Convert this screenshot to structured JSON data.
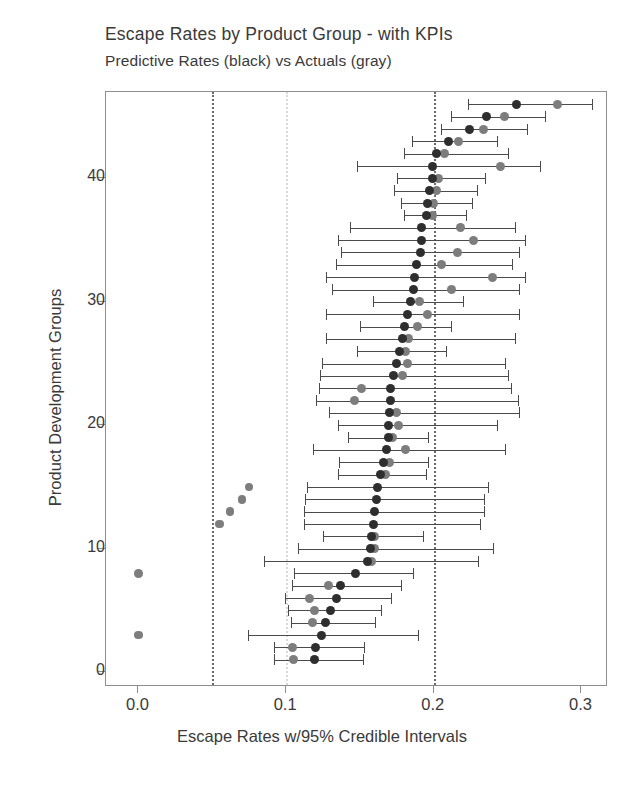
{
  "chart": {
    "title": "Escape Rates by Product Group - with KPIs",
    "subtitle": "Predictive Rates (black) vs Actuals (gray)",
    "xlabel": "Escape Rates w/95% Credible Intervals",
    "ylabel": "Product Development Groups",
    "xticklabels": [
      "0.0",
      "0.1",
      "0.2",
      "0.3"
    ],
    "yticklabels": [
      "0",
      "10",
      "20",
      "30",
      "40"
    ]
  },
  "colors": {
    "predictive": "#2e2e2e",
    "actual": "#7d7d7d",
    "interval": "#4a4a4a",
    "refline": "#6a6a6a",
    "refline_faint": "#d9d9d9",
    "frame": "#8d8d8d",
    "text": "#3a3a3a",
    "background": "#ffffff"
  },
  "chart_data": {
    "type": "scatter",
    "title": "Escape Rates by Product Group - with KPIs",
    "subtitle": "Predictive Rates (black) vs Actuals (gray)",
    "xlabel": "Escape Rates w/95% Credible Intervals",
    "ylabel": "Product Development Groups",
    "xlim": [
      -0.022,
      0.318
    ],
    "ylim": [
      -1.2,
      47.0
    ],
    "xticks": [
      0.0,
      0.1,
      0.2,
      0.3
    ],
    "yticks": [
      0,
      10,
      20,
      30,
      40
    ],
    "grid": false,
    "legend": null,
    "reference_lines": [
      {
        "x": 0.05,
        "style": "dotted",
        "color": "#6a6a6a"
      },
      {
        "x": 0.1,
        "style": "dotted",
        "color": "#d9d9d9"
      },
      {
        "x": 0.2,
        "style": "dotted",
        "color": "#6a6a6a"
      }
    ],
    "series": [
      {
        "name": "Predictive Rates",
        "color": "#2e2e2e",
        "marker": "circle"
      },
      {
        "name": "Actuals",
        "color": "#7d7d7d",
        "marker": "circle"
      }
    ],
    "points": [
      {
        "group": 46,
        "predictive": 0.256,
        "actual": 0.284,
        "ci_low": 0.223,
        "ci_high": 0.307
      },
      {
        "group": 45,
        "predictive": 0.236,
        "actual": 0.248,
        "ci_low": 0.212,
        "ci_high": 0.275
      },
      {
        "group": 44,
        "predictive": 0.224,
        "actual": 0.234,
        "ci_low": 0.205,
        "ci_high": 0.263
      },
      {
        "group": 43,
        "predictive": 0.21,
        "actual": 0.217,
        "ci_low": 0.185,
        "ci_high": 0.243
      },
      {
        "group": 42,
        "predictive": 0.202,
        "actual": 0.207,
        "ci_low": 0.18,
        "ci_high": 0.25
      },
      {
        "group": 41,
        "predictive": 0.199,
        "actual": 0.245,
        "ci_low": 0.148,
        "ci_high": 0.272
      },
      {
        "group": 40,
        "predictive": 0.199,
        "actual": 0.203,
        "ci_low": 0.175,
        "ci_high": 0.235
      },
      {
        "group": 39,
        "predictive": 0.197,
        "actual": 0.202,
        "ci_low": 0.173,
        "ci_high": 0.229
      },
      {
        "group": 38,
        "predictive": 0.196,
        "actual": 0.2,
        "ci_low": 0.178,
        "ci_high": 0.226
      },
      {
        "group": 37,
        "predictive": 0.195,
        "actual": 0.199,
        "ci_low": 0.18,
        "ci_high": 0.222
      },
      {
        "group": 36,
        "predictive": 0.192,
        "actual": 0.218,
        "ci_low": 0.143,
        "ci_high": 0.255
      },
      {
        "group": 35,
        "predictive": 0.192,
        "actual": 0.227,
        "ci_low": 0.135,
        "ci_high": 0.262
      },
      {
        "group": 34,
        "predictive": 0.191,
        "actual": 0.216,
        "ci_low": 0.137,
        "ci_high": 0.258
      },
      {
        "group": 33,
        "predictive": 0.188,
        "actual": 0.205,
        "ci_low": 0.134,
        "ci_high": 0.253
      },
      {
        "group": 32,
        "predictive": 0.187,
        "actual": 0.24,
        "ci_low": 0.127,
        "ci_high": 0.262
      },
      {
        "group": 31,
        "predictive": 0.186,
        "actual": 0.212,
        "ci_low": 0.131,
        "ci_high": 0.258
      },
      {
        "group": 30,
        "predictive": 0.184,
        "actual": 0.19,
        "ci_low": 0.159,
        "ci_high": 0.22
      },
      {
        "group": 29,
        "predictive": 0.182,
        "actual": 0.196,
        "ci_low": 0.127,
        "ci_high": 0.258
      },
      {
        "group": 28,
        "predictive": 0.18,
        "actual": 0.189,
        "ci_low": 0.15,
        "ci_high": 0.212
      },
      {
        "group": 27,
        "predictive": 0.179,
        "actual": 0.183,
        "ci_low": 0.127,
        "ci_high": 0.255
      },
      {
        "group": 26,
        "predictive": 0.177,
        "actual": 0.181,
        "ci_low": 0.148,
        "ci_high": 0.208
      },
      {
        "group": 25,
        "predictive": 0.175,
        "actual": 0.182,
        "ci_low": 0.124,
        "ci_high": 0.248
      },
      {
        "group": 24,
        "predictive": 0.173,
        "actual": 0.179,
        "ci_low": 0.123,
        "ci_high": 0.25
      },
      {
        "group": 23,
        "predictive": 0.171,
        "actual": 0.151,
        "ci_low": 0.122,
        "ci_high": 0.252
      },
      {
        "group": 22,
        "predictive": 0.171,
        "actual": 0.146,
        "ci_low": 0.12,
        "ci_high": 0.257
      },
      {
        "group": 21,
        "predictive": 0.17,
        "actual": 0.175,
        "ci_low": 0.129,
        "ci_high": 0.258
      },
      {
        "group": 20,
        "predictive": 0.169,
        "actual": 0.176,
        "ci_low": 0.135,
        "ci_high": 0.243
      },
      {
        "group": 19,
        "predictive": 0.169,
        "actual": 0.172,
        "ci_low": 0.142,
        "ci_high": 0.196
      },
      {
        "group": 18,
        "predictive": 0.168,
        "actual": 0.181,
        "ci_low": 0.118,
        "ci_high": 0.248
      },
      {
        "group": 17,
        "predictive": 0.166,
        "actual": 0.17,
        "ci_low": 0.136,
        "ci_high": 0.196
      },
      {
        "group": 16,
        "predictive": 0.164,
        "actual": 0.167,
        "ci_low": 0.135,
        "ci_high": 0.195
      },
      {
        "group": 15,
        "predictive": 0.162,
        "actual": 0.075,
        "ci_low": 0.114,
        "ci_high": 0.237
      },
      {
        "group": 14,
        "predictive": 0.161,
        "actual": 0.07,
        "ci_low": 0.113,
        "ci_high": 0.234
      },
      {
        "group": 13,
        "predictive": 0.16,
        "actual": 0.062,
        "ci_low": 0.112,
        "ci_high": 0.234
      },
      {
        "group": 12,
        "predictive": 0.159,
        "actual": 0.055,
        "ci_low": 0.112,
        "ci_high": 0.231
      },
      {
        "group": 11,
        "predictive": 0.158,
        "actual": 0.16,
        "ci_low": 0.125,
        "ci_high": 0.193
      },
      {
        "group": 10,
        "predictive": 0.157,
        "actual": 0.16,
        "ci_low": 0.108,
        "ci_high": 0.24
      },
      {
        "group": 9,
        "predictive": 0.155,
        "actual": 0.158,
        "ci_low": 0.085,
        "ci_high": 0.23
      },
      {
        "group": 8,
        "predictive": 0.147,
        "actual": 0.0,
        "ci_low": 0.105,
        "ci_high": 0.186
      },
      {
        "group": 7,
        "predictive": 0.137,
        "actual": 0.129,
        "ci_low": 0.104,
        "ci_high": 0.178
      },
      {
        "group": 6,
        "predictive": 0.134,
        "actual": 0.116,
        "ci_low": 0.099,
        "ci_high": 0.171
      },
      {
        "group": 5,
        "predictive": 0.13,
        "actual": 0.119,
        "ci_low": 0.101,
        "ci_high": 0.164
      },
      {
        "group": 4,
        "predictive": 0.127,
        "actual": 0.118,
        "ci_low": 0.103,
        "ci_high": 0.16
      },
      {
        "group": 3,
        "predictive": 0.124,
        "actual": 0.0,
        "ci_low": 0.074,
        "ci_high": 0.189
      },
      {
        "group": 2,
        "predictive": 0.12,
        "actual": 0.104,
        "ci_low": 0.092,
        "ci_high": 0.153
      },
      {
        "group": 1,
        "predictive": 0.119,
        "actual": 0.105,
        "ci_low": 0.092,
        "ci_high": 0.152
      }
    ]
  }
}
